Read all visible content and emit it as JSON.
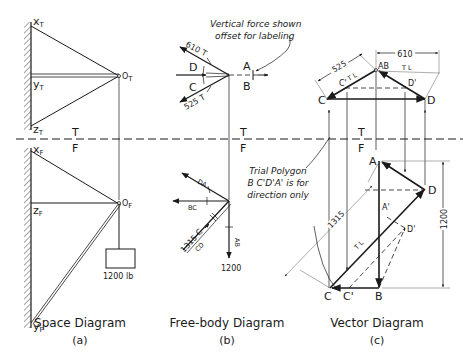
{
  "figure": {
    "panels": [
      {
        "id": "a",
        "caption": "Space Diagram",
        "sub": "(a)"
      },
      {
        "id": "b",
        "caption": "Free-body Diagram",
        "sub": "(b)"
      },
      {
        "id": "c",
        "caption": "Vector Diagram",
        "sub": "(c)"
      }
    ],
    "fold_line": {
      "top": "T",
      "bottom": "F"
    }
  },
  "space_diagram": {
    "points_top": {
      "x": "x",
      "x_sub": "T",
      "y": "y",
      "y_sub": "T",
      "z": "z",
      "z_sub": "T",
      "o": "O",
      "o_sub": "T"
    },
    "points_front": {
      "x": "x",
      "x_sub": "F",
      "y": "y",
      "y_sub": "F",
      "z": "z",
      "z_sub": "F",
      "o": "O",
      "o_sub": "F"
    },
    "load_label": "1200 lb"
  },
  "free_body": {
    "top_view": {
      "force_1": "610 T",
      "force_2": "525 T",
      "region_a": "A",
      "region_b": "B",
      "region_c": "C",
      "region_d": "D"
    },
    "annotation": "Vertical force shown offset for labeling",
    "annotation_lines": [
      "Vertical force shown",
      "offset for labeling"
    ],
    "front_view": {
      "da": "DA",
      "bc": "BC",
      "cd": "CD",
      "ab": "AB",
      "compression": "1315 C",
      "load": "1200"
    }
  },
  "vector_diagram": {
    "top": {
      "ab": "AB",
      "c": "C",
      "d": "D",
      "c_prime": "C'",
      "d_prime": "D'",
      "dim_525": "525",
      "dim_610": "610",
      "tl_1": "T L",
      "tl_2": "T L"
    },
    "front": {
      "a": "A",
      "b": "B",
      "c": "C",
      "d": "D",
      "c_prime": "C'",
      "d_prime": "D'",
      "a_prime": "A'",
      "dim_1315": "1315",
      "dim_1200": "1200",
      "tl": "T L"
    },
    "annotation_lines": [
      "Trial Polygon",
      "B C'D'A' is for",
      "direction only"
    ]
  }
}
